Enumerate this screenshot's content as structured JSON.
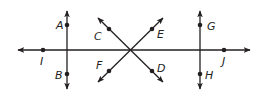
{
  "diagram": {
    "lines": [
      {
        "id": "horizontal-line-IJ",
        "x1": 18,
        "y1": 50,
        "x2": 250,
        "y2": 50,
        "points": [
          "I",
          "J"
        ]
      },
      {
        "id": "vertical-line-AB",
        "x1": 67,
        "y1": 11,
        "x2": 67,
        "y2": 89,
        "points": [
          "A",
          "B"
        ]
      },
      {
        "id": "line-CD",
        "x1": 98,
        "y1": 18,
        "x2": 163,
        "y2": 82,
        "points": [
          "C",
          "D"
        ]
      },
      {
        "id": "line-FE",
        "x1": 98,
        "y1": 82,
        "x2": 163,
        "y2": 18,
        "points": [
          "F",
          "E"
        ]
      },
      {
        "id": "vertical-line-GH",
        "x1": 200,
        "y1": 11,
        "x2": 200,
        "y2": 89,
        "points": [
          "G",
          "H"
        ]
      }
    ],
    "points": [
      {
        "label": "A",
        "x": 67,
        "y": 25,
        "lx": 56,
        "ly": 29
      },
      {
        "label": "B",
        "x": 67,
        "y": 74,
        "lx": 55,
        "ly": 79
      },
      {
        "label": "C",
        "x": 109,
        "y": 29,
        "lx": 94,
        "ly": 40
      },
      {
        "label": "D",
        "x": 152,
        "y": 71,
        "lx": 157,
        "ly": 72
      },
      {
        "label": "E",
        "x": 152,
        "y": 29,
        "lx": 157,
        "ly": 38
      },
      {
        "label": "F",
        "x": 109,
        "y": 71,
        "lx": 96,
        "ly": 69
      },
      {
        "label": "G",
        "x": 200,
        "y": 25,
        "lx": 207,
        "ly": 30
      },
      {
        "label": "H",
        "x": 200,
        "y": 74,
        "lx": 205,
        "ly": 79
      },
      {
        "label": "I",
        "x": 43,
        "y": 50,
        "lx": 40,
        "ly": 65
      },
      {
        "label": "J",
        "x": 224,
        "y": 50,
        "lx": 222,
        "ly": 65
      }
    ],
    "colors": {
      "stroke": "#231f20",
      "background": "#ffffff"
    }
  }
}
